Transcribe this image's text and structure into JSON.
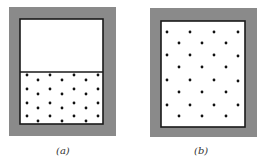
{
  "figure": {
    "panels": [
      {
        "id": "a",
        "label": "(a)",
        "description": "Container with partition; particles confined to lower section, upper section empty",
        "frame": {
          "x": 9,
          "y": 7,
          "w": 107,
          "h": 129
        },
        "inner": {
          "x": 20,
          "y": 19,
          "w": 83,
          "h": 105
        },
        "partition_y": 72,
        "dots": [
          [
            27,
            75
          ],
          [
            38,
            80
          ],
          [
            50,
            75
          ],
          [
            62,
            80
          ],
          [
            74,
            75
          ],
          [
            86,
            80
          ],
          [
            98,
            75
          ],
          [
            27,
            89
          ],
          [
            38,
            94
          ],
          [
            50,
            89
          ],
          [
            62,
            94
          ],
          [
            74,
            89
          ],
          [
            86,
            94
          ],
          [
            98,
            89
          ],
          [
            27,
            103
          ],
          [
            38,
            108
          ],
          [
            50,
            103
          ],
          [
            62,
            108
          ],
          [
            74,
            103
          ],
          [
            86,
            108
          ],
          [
            98,
            103
          ],
          [
            27,
            116
          ],
          [
            38,
            121
          ],
          [
            50,
            116
          ],
          [
            62,
            121
          ],
          [
            74,
            116
          ],
          [
            86,
            121
          ],
          [
            98,
            116
          ]
        ]
      },
      {
        "id": "b",
        "label": "(b)",
        "description": "Partition removed; particles spread throughout full container",
        "frame": {
          "x": 150,
          "y": 8,
          "w": 107,
          "h": 129
        },
        "inner": {
          "x": 161,
          "y": 21,
          "w": 84,
          "h": 106
        },
        "dots": [
          [
            167,
            32
          ],
          [
            190,
            32
          ],
          [
            214,
            32
          ],
          [
            238,
            32
          ],
          [
            179,
            43
          ],
          [
            202,
            43
          ],
          [
            226,
            43
          ],
          [
            167,
            55
          ],
          [
            190,
            55
          ],
          [
            214,
            55
          ],
          [
            238,
            56
          ],
          [
            179,
            67
          ],
          [
            202,
            67
          ],
          [
            226,
            67
          ],
          [
            167,
            80
          ],
          [
            190,
            80
          ],
          [
            214,
            80
          ],
          [
            238,
            81
          ],
          [
            179,
            92
          ],
          [
            202,
            92
          ],
          [
            226,
            92
          ],
          [
            167,
            105
          ],
          [
            190,
            105
          ],
          [
            214,
            105
          ],
          [
            238,
            105
          ],
          [
            179,
            116
          ],
          [
            202,
            116
          ],
          [
            226,
            116
          ]
        ]
      }
    ],
    "colors": {
      "frame": "#8a8a8a",
      "inner_fill": "#ffffff",
      "border": "#1a1a1a",
      "dot": "#111111",
      "label": "#333333"
    }
  }
}
